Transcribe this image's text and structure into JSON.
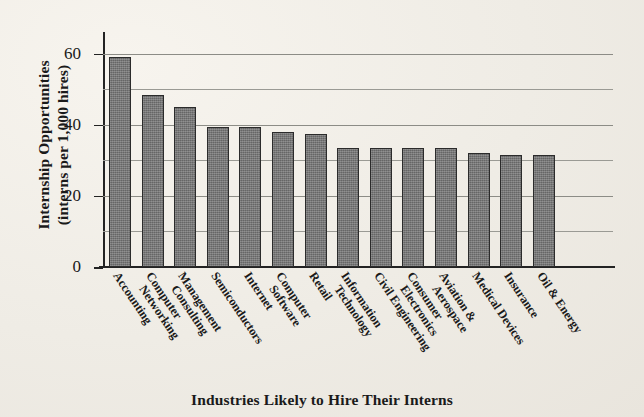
{
  "chart_data": {
    "type": "bar",
    "title": "",
    "xlabel": "Industries Likely to Hire Their Interns",
    "ylabel": "Internship Opportunities (interns per 1,000 hires)",
    "ylabel_line1": "Internship Opportunities",
    "ylabel_line2": "(interns per 1,000 hires)",
    "ylim": [
      0,
      65
    ],
    "yticks": [
      0,
      20,
      40,
      60
    ],
    "ytick_labels": [
      "0",
      "20",
      "40",
      "60"
    ],
    "minor_gridlines": [
      10,
      30,
      50
    ],
    "grid": true,
    "legend": "none",
    "bar_color": "#6f6f6f",
    "bar_edge_color": "#2b2b2b",
    "background_color": "#f2efe9",
    "categories": [
      "Accounting",
      "Computer Networking",
      "Management Consulting",
      "Semiconductors",
      "Internet",
      "Computer Software",
      "Retail",
      "Information Technology",
      "Civil Engineering",
      "Consumer Electronics",
      "Aviation & Aerospace",
      "Medical Devices",
      "Insurance",
      "Oil & Energy"
    ],
    "category_lines": [
      [
        "Accounting"
      ],
      [
        "Computer",
        "Networking"
      ],
      [
        "Management",
        "Consulting"
      ],
      [
        "Semiconductors"
      ],
      [
        "Internet"
      ],
      [
        "Computer",
        "Software"
      ],
      [
        "Retail"
      ],
      [
        "Information",
        "Technology"
      ],
      [
        "Civil Engineering"
      ],
      [
        "Consumer",
        "Electronics"
      ],
      [
        "Aviation &",
        "Aerospace"
      ],
      [
        "Medical Devices"
      ],
      [
        "Insurance"
      ],
      [
        "Oil & Energy"
      ]
    ],
    "values": [
      59,
      48.5,
      45,
      39.5,
      39.5,
      38,
      37.5,
      33.5,
      33.5,
      33.5,
      33.5,
      32,
      31.5,
      31.5
    ]
  }
}
